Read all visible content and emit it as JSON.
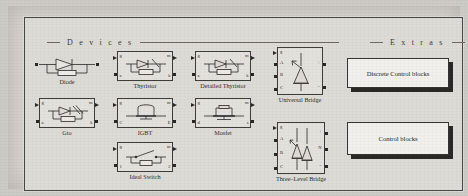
{
  "window": {
    "title": "Power Electronics library palette"
  },
  "sections": [
    {
      "id": "devices",
      "label": "D e v i c e s"
    },
    {
      "id": "extras",
      "label": "E x t r a s"
    }
  ],
  "devices": [
    {
      "name": "Diode",
      "caption": "Diode",
      "symbol": "diode",
      "ports": {
        "left": [
          ""
        ],
        "right": [
          ""
        ]
      },
      "labels": {
        "top_left": "",
        "top_right": "",
        "bottom_left": "",
        "bottom_right": ""
      }
    },
    {
      "name": "Thyristor",
      "caption": "Thyristor",
      "symbol": "thyristor",
      "labels": {
        "top_left": "g",
        "top_right": "m",
        "bottom_left": "a",
        "bottom_right": "k"
      }
    },
    {
      "name": "Detailed Thyristor",
      "caption": "Detailed Thyristor",
      "symbol": "thyristor",
      "labels": {
        "top_left": "g",
        "top_right": "m",
        "bottom_left": "a",
        "bottom_right": "k"
      }
    },
    {
      "name": "Gto",
      "caption": "Gto",
      "symbol": "thyristor",
      "labels": {
        "top_left": "g",
        "top_right": "m",
        "bottom_left": "a",
        "bottom_right": "k"
      }
    },
    {
      "name": "IGBT",
      "caption": "IGBT",
      "symbol": "igbt",
      "labels": {
        "top_left": "g",
        "top_right": "m",
        "bottom_left": "C",
        "bottom_right": "E"
      }
    },
    {
      "name": "Mosfet",
      "caption": "Mosfet",
      "symbol": "mosfet",
      "labels": {
        "top_left": "g",
        "top_right": "m",
        "bottom_left": "d",
        "bottom_right": "s"
      }
    },
    {
      "name": "Ideal Switch",
      "caption": "Ideal Switch",
      "symbol": "switch",
      "labels": {
        "top_left": "g",
        "top_right": "m",
        "bottom_left": "1",
        "bottom_right": "2"
      }
    },
    {
      "name": "Universal Bridge",
      "caption": "Universal Bridge",
      "symbol": "bridge",
      "inputs": [
        "g",
        "A",
        "B",
        "C"
      ],
      "outputs": [
        "+",
        "–"
      ]
    },
    {
      "name": "Three-Level Bridge",
      "caption": "Three–Level Bridge",
      "symbol": "three-level-bridge",
      "inputs": [
        "g",
        "A",
        "B",
        "C"
      ],
      "outputs": [
        "+",
        "N",
        "–"
      ]
    }
  ],
  "extras": [
    {
      "name": "Discrete Control blocks",
      "label": "Discrete Control blocks"
    },
    {
      "name": "Control blocks",
      "label": "Control blocks"
    }
  ],
  "colors": {
    "page": "#d6d4cf",
    "frame_border": "#4a4844",
    "block_fill": "#e3e1dc",
    "ink": "#2b2926",
    "shadow": "#2b2926",
    "extras_fill": "#f2f0ec"
  }
}
